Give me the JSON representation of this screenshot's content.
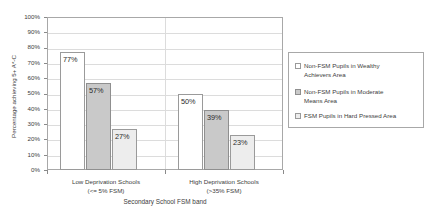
{
  "chart_data": {
    "type": "bar",
    "title": "",
    "subtitle": "",
    "xlabel": "Secondary School FSM band",
    "ylabel": "Percentage achieving 5+ A*-C",
    "categories": [
      "Low Deprivation Schools (<= 5% FSM)",
      "High Deprivation Schools (>35% FSM)"
    ],
    "category_lines": [
      [
        "Low Deprivation Schools",
        "(<= 5% FSM)"
      ],
      [
        "High Deprivation Schools",
        "(>35% FSM)"
      ]
    ],
    "series": [
      {
        "name": "Non-FSM Pupils in  Wealthy Achievers Area",
        "name_lines": [
          "Non-FSM Pupils in  Wealthy",
          "Achievers Area"
        ],
        "values": [
          77,
          50
        ],
        "labels": [
          "77%",
          "50%"
        ],
        "color": "#ffffff",
        "border_color": "#9a9a9a"
      },
      {
        "name": "Non-FSM Pupils in  Moderate Means Area",
        "name_lines": [
          "Non-FSM Pupils in  Moderate",
          "Means Area"
        ],
        "values": [
          57,
          39
        ],
        "labels": [
          "57%",
          "39%"
        ],
        "color": "#c9c9c9",
        "border_color": "#8f8f8f"
      },
      {
        "name": "FSM Pupils in  Hard Pressed Area",
        "name_lines": [
          "FSM Pupils in  Hard Pressed Area"
        ],
        "values": [
          27,
          23
        ],
        "labels": [
          "27%",
          "23%"
        ],
        "color": "#ededed",
        "border_color": "#9a9a9a"
      }
    ],
    "ylim": [
      0,
      100
    ],
    "ytick_values": [
      0,
      10,
      20,
      30,
      40,
      50,
      60,
      70,
      80,
      90,
      100
    ],
    "ytick_labels": [
      "0%",
      "10%",
      "20%",
      "30%",
      "40%",
      "50%",
      "60%",
      "70%",
      "80%",
      "90%",
      "100%"
    ],
    "grid": true,
    "grid_color": "#dcdcdc",
    "legend_position": "right",
    "plot_border_color": "#a8a8a8",
    "background": "#ffffff"
  }
}
